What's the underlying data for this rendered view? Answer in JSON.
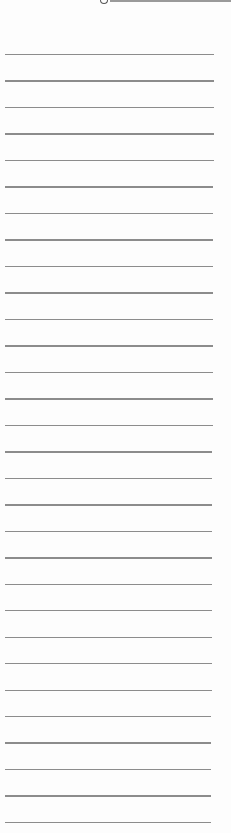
{
  "document": {
    "type": "lined-paper",
    "background_color": "#fdfdfd",
    "rule_color": "#8c8c8c",
    "rule_count": 30,
    "first_rule_y": 54,
    "rule_spacing": 26.48,
    "rule_left": 5,
    "rule_right_top": 214,
    "rule_right_bottom": 211,
    "top_fragment": {
      "description": "cut-off handwritten descender at top edge",
      "text": ""
    },
    "lines_text": [
      "",
      "",
      "",
      "",
      "",
      "",
      "",
      "",
      "",
      "",
      "",
      "",
      "",
      "",
      "",
      "",
      "",
      "",
      "",
      "",
      "",
      "",
      "",
      "",
      "",
      "",
      "",
      "",
      "",
      ""
    ]
  }
}
